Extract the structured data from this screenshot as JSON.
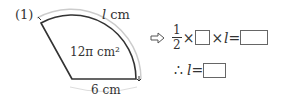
{
  "problem": {
    "number_label": "(1)",
    "arc_label_var": "l",
    "arc_label_unit": " cm",
    "area_label": "12π cm²",
    "radius_label": "6 cm"
  },
  "equation": {
    "arrow_icon": "hollow-right-arrow",
    "frac_num": "1",
    "frac_den": "2",
    "times1": "×",
    "times2": "×",
    "var": "l",
    "equals": "=",
    "therefore": "∴",
    "line2_var": "l",
    "line2_equals": "="
  }
}
